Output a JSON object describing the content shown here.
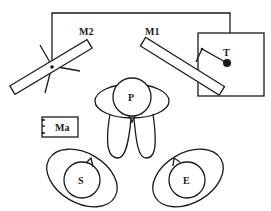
{
  "diagram": {
    "labels": {
      "mirror2": "M2",
      "mirror1": "M1",
      "target": "T",
      "person_p": "P",
      "ma": "Ma",
      "person_s": "S",
      "person_e": "E"
    },
    "colors": {
      "stroke": "#1a1a1a",
      "background": "#ffffff"
    }
  }
}
